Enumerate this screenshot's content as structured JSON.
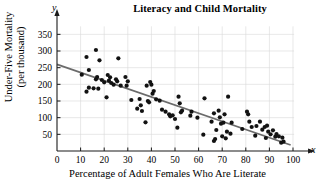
{
  "chart_data": {
    "type": "scatter",
    "title": "Literacy and Child Mortality",
    "xlabel": "Percentage of Adult Females Who Are Literate",
    "ylabel_line1": "Under-Five Mortality",
    "ylabel_line2": "(per thousand)",
    "x_axis_letter": "x",
    "y_axis_letter": "y",
    "xlim": [
      0,
      103
    ],
    "ylim": [
      0,
      375
    ],
    "xticks": [
      0,
      10,
      20,
      30,
      40,
      50,
      60,
      70,
      80,
      90,
      100
    ],
    "xtick_labels": [
      "0",
      "10",
      "20",
      "30",
      "40",
      "50",
      "60",
      "70",
      "80",
      "90",
      "100"
    ],
    "yticks": [
      50,
      100,
      150,
      200,
      250,
      300,
      350
    ],
    "ytick_labels": [
      "50",
      "100",
      "150",
      "200",
      "250",
      "300",
      "350"
    ],
    "grid": true,
    "grid_color": "#d8d8d8",
    "legend": null,
    "point_color": "#121212",
    "point_radius": 2.1,
    "trend_line": {
      "name": "least-squares regression line",
      "color": "#6b6b6b",
      "x_start": 0,
      "y_start": 260,
      "x_end": 99,
      "y_end": 18
    },
    "points": [
      [
        10.5,
        229
      ],
      [
        12.5,
        282
      ],
      [
        12.5,
        178
      ],
      [
        13.5,
        243
      ],
      [
        13.5,
        190
      ],
      [
        15.5,
        188
      ],
      [
        16.5,
        303
      ],
      [
        16.5,
        215
      ],
      [
        17.0,
        222
      ],
      [
        17.5,
        187
      ],
      [
        18.0,
        272
      ],
      [
        19.0,
        213
      ],
      [
        20.0,
        206
      ],
      [
        21.0,
        161
      ],
      [
        21.5,
        228
      ],
      [
        22.0,
        211
      ],
      [
        22.5,
        221
      ],
      [
        23.0,
        204
      ],
      [
        24.0,
        199
      ],
      [
        25.0,
        215
      ],
      [
        25.5,
        209
      ],
      [
        26.0,
        278
      ],
      [
        27.0,
        196
      ],
      [
        29.0,
        222
      ],
      [
        29.5,
        196
      ],
      [
        30.0,
        209
      ],
      [
        31.5,
        153
      ],
      [
        34.0,
        127
      ],
      [
        35.0,
        156
      ],
      [
        35.5,
        137
      ],
      [
        36.0,
        120
      ],
      [
        37.5,
        86
      ],
      [
        38.0,
        196
      ],
      [
        38.5,
        150
      ],
      [
        39.0,
        146
      ],
      [
        39.5,
        207
      ],
      [
        40.0,
        199
      ],
      [
        40.5,
        172
      ],
      [
        41.0,
        180
      ],
      [
        42.0,
        155
      ],
      [
        43.5,
        151
      ],
      [
        44.5,
        124
      ],
      [
        46.0,
        118
      ],
      [
        47.5,
        110
      ],
      [
        48.0,
        104
      ],
      [
        49.0,
        107
      ],
      [
        50.0,
        96
      ],
      [
        51.0,
        70
      ],
      [
        51.5,
        163
      ],
      [
        52.0,
        143
      ],
      [
        52.5,
        116
      ],
      [
        53.0,
        121
      ],
      [
        56.5,
        106
      ],
      [
        57.0,
        118
      ],
      [
        59.5,
        100
      ],
      [
        62.0,
        49
      ],
      [
        62.5,
        158
      ],
      [
        65.5,
        88
      ],
      [
        66.5,
        113
      ],
      [
        66.5,
        30
      ],
      [
        67.0,
        36
      ],
      [
        67.5,
        63
      ],
      [
        68.5,
        121
      ],
      [
        69.0,
        101
      ],
      [
        69.5,
        82
      ],
      [
        70.0,
        44
      ],
      [
        70.5,
        85
      ],
      [
        71.0,
        110
      ],
      [
        71.5,
        38
      ],
      [
        72.0,
        58
      ],
      [
        72.5,
        163
      ],
      [
        73.5,
        52
      ],
      [
        74.0,
        85
      ],
      [
        78.5,
        66
      ],
      [
        80.5,
        118
      ],
      [
        81.0,
        110
      ],
      [
        81.5,
        88
      ],
      [
        82.5,
        72
      ],
      [
        84.0,
        46
      ],
      [
        84.5,
        75
      ],
      [
        86.0,
        88
      ],
      [
        87.0,
        64
      ],
      [
        88.0,
        72
      ],
      [
        88.5,
        39
      ],
      [
        89.0,
        76
      ],
      [
        89.5,
        58
      ],
      [
        90.5,
        50
      ],
      [
        91.5,
        62
      ],
      [
        92.5,
        43
      ],
      [
        93.0,
        51
      ],
      [
        94.0,
        44
      ],
      [
        95.0,
        25
      ],
      [
        95.5,
        40
      ],
      [
        96.0,
        28
      ]
    ]
  }
}
